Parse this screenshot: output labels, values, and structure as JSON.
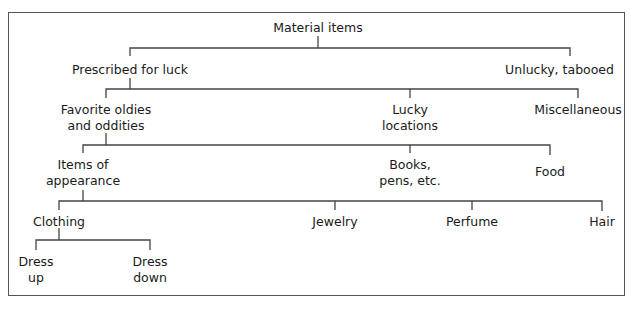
{
  "diagram": {
    "type": "tree",
    "line_color": "#444444",
    "root": {
      "label": "Material items",
      "children": [
        {
          "label": "Prescribed for luck",
          "children": [
            {
              "label": "Favorite oldies and oddities",
              "children": [
                {
                  "label": "Items of appearance",
                  "children": [
                    {
                      "label": "Clothing",
                      "children": [
                        {
                          "label": "Dress up"
                        },
                        {
                          "label": "Dress down"
                        }
                      ]
                    },
                    {
                      "label": "Jewelry"
                    },
                    {
                      "label": "Perfume"
                    },
                    {
                      "label": "Hair"
                    }
                  ]
                },
                {
                  "label": "Books, pens, etc."
                },
                {
                  "label": "Food"
                }
              ]
            },
            {
              "label": "Lucky locations"
            },
            {
              "label": "Miscellaneous"
            }
          ]
        },
        {
          "label": "Unlucky, tabooed"
        }
      ]
    }
  },
  "nodes": {
    "material_items": "Material items",
    "prescribed_for_luck": "Prescribed for luck",
    "unlucky_tabooed": "Unlucky, tabooed",
    "favorite_oldies_l1": "Favorite oldies",
    "favorite_oldies_l2": "and oddities",
    "lucky_locations_l1": "Lucky",
    "lucky_locations_l2": "locations",
    "miscellaneous": "Miscellaneous",
    "items_of_appearance_l1": "Items of",
    "items_of_appearance_l2": "appearance",
    "books_pens_l1": "Books,",
    "books_pens_l2": "pens, etc.",
    "food": "Food",
    "clothing": "Clothing",
    "jewelry": "Jewelry",
    "perfume": "Perfume",
    "hair": "Hair",
    "dress_up_l1": "Dress",
    "dress_up_l2": "up",
    "dress_down_l1": "Dress",
    "dress_down_l2": "down"
  }
}
